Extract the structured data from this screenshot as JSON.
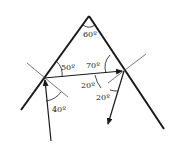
{
  "diagram": {
    "colors": {
      "ink": "#1a1a1a",
      "normal": "#555555",
      "background": "#ffffff"
    },
    "labels": {
      "apex_angle": "60º",
      "left_refraction_angle": "50º",
      "incidence_angle": "40º",
      "internal_angle": "70º",
      "right_internal_angle": "20º",
      "emergence_angle": "20º"
    }
  }
}
